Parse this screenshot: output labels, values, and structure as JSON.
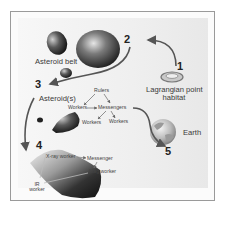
{
  "steps": [
    {
      "number": "1",
      "label_line1": "Lagrangian point",
      "label_line2": "habitat"
    },
    {
      "number": "2",
      "label": "Asteroid belt"
    },
    {
      "number": "3",
      "label": "Asteroid(s)"
    },
    {
      "number": "4"
    },
    {
      "number": "5",
      "label": "Earth"
    }
  ],
  "hierarchy_1": {
    "rulers": "Rulers",
    "messengers": "Messengers",
    "workers_left": "Workers",
    "workers_bottom_left": "Workers",
    "workers_bottom_right": "Workers"
  },
  "hierarchy_2": {
    "xray_worker": "X-ray worker",
    "messenger": "Messenger",
    "mag_worker": "Mag worker",
    "ir_worker_line1": "IR",
    "ir_worker_line2": "worker"
  },
  "colors": {
    "arrow": "#555555",
    "frame": "#9a9a9a",
    "panel": "#efefef",
    "text": "#3a3a3a"
  }
}
